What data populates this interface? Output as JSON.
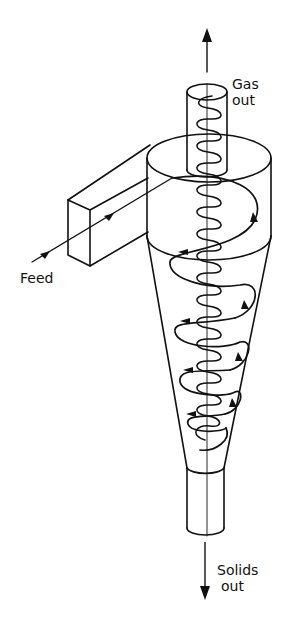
{
  "labels": {
    "gas_out_line1": "Gas",
    "gas_out_line2": "out",
    "feed": "Feed",
    "solids_out_line1": "Solids",
    "solids_out_line2": "out"
  },
  "colors": {
    "stroke": "#111111",
    "background": "#ffffff"
  }
}
